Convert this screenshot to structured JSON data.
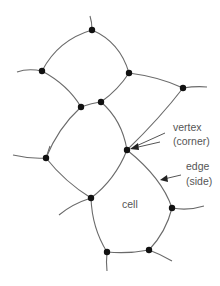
{
  "diagram": {
    "type": "cell-network",
    "labels": {
      "vertex_line1": "vertex",
      "vertex_line2": "(corner)",
      "edge_line1": "edge",
      "edge_line2": "(side)",
      "cell": "cell"
    },
    "colors": {
      "edge": "#6a6a6a",
      "vertex": "#111111",
      "text": "#555555"
    },
    "vertices": [
      {
        "id": "v-top",
        "x": 92,
        "y": 30
      },
      {
        "id": "v-upper-left",
        "x": 42,
        "y": 71
      },
      {
        "id": "v-upper-right",
        "x": 129,
        "y": 73
      },
      {
        "id": "v-far-right",
        "x": 183,
        "y": 88
      },
      {
        "id": "v-mid-left",
        "x": 81,
        "y": 107
      },
      {
        "id": "v-mid-right",
        "x": 101,
        "y": 102
      },
      {
        "id": "v-center",
        "x": 127,
        "y": 150
      },
      {
        "id": "v-lower-left",
        "x": 46,
        "y": 158
      },
      {
        "id": "v-lower-center",
        "x": 91,
        "y": 198
      },
      {
        "id": "v-lower-right",
        "x": 172,
        "y": 208
      },
      {
        "id": "v-bottom-left",
        "x": 107,
        "y": 252
      },
      {
        "id": "v-bottom-right",
        "x": 149,
        "y": 250
      }
    ]
  }
}
